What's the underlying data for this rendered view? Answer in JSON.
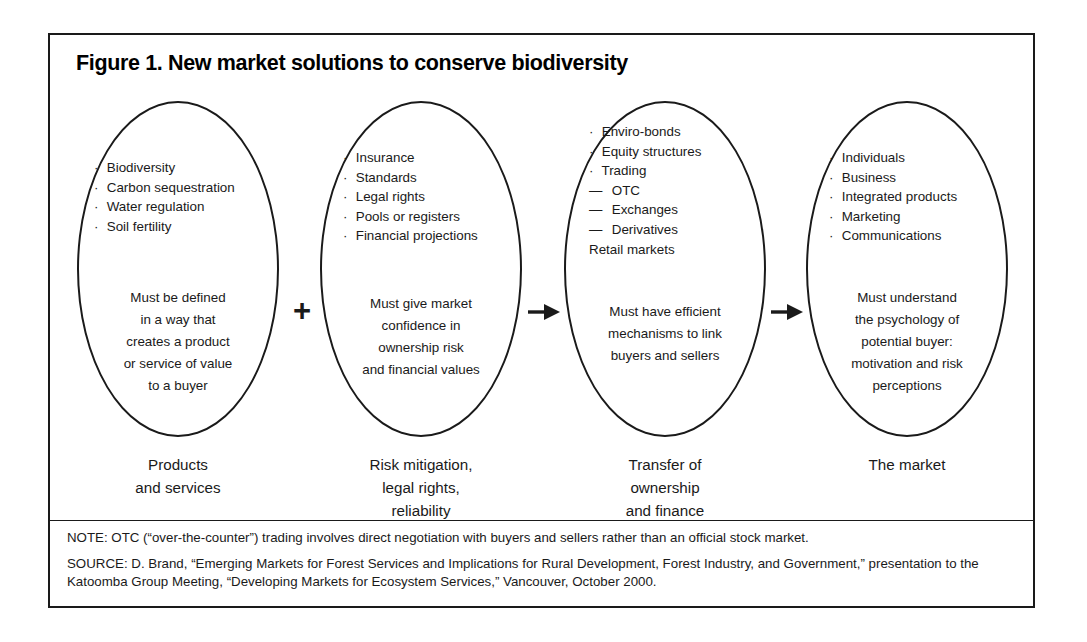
{
  "figure": {
    "title": "Figure 1. New market solutions to conserve biodiversity"
  },
  "stages": [
    {
      "caption": "Products\nand services",
      "bullets": [
        {
          "mark": "·",
          "text": "Biodiversity"
        },
        {
          "mark": "·",
          "text": "Carbon sequestration"
        },
        {
          "mark": "·",
          "text": "Water regulation"
        },
        {
          "mark": "·",
          "text": "Soil fertility"
        }
      ],
      "description": "Must be defined\nin a way that\ncreates a product\nor service of value\nto a buyer"
    },
    {
      "caption": "Risk mitigation,\nlegal rights,\nreliability",
      "bullets": [
        {
          "mark": "·",
          "text": "Insurance"
        },
        {
          "mark": "·",
          "text": "Standards"
        },
        {
          "mark": "·",
          "text": "Legal rights"
        },
        {
          "mark": "·",
          "text": "Pools or registers"
        },
        {
          "mark": "·",
          "text": "Financial projections"
        }
      ],
      "description": "Must give market\nconfidence in\nownership risk\nand financial values"
    },
    {
      "caption": "Transfer of\nownership\nand finance",
      "bullets": [
        {
          "mark": "·",
          "text": "Enviro-bonds"
        },
        {
          "mark": "·",
          "text": "Equity structures"
        },
        {
          "mark": "·",
          "text": "Trading"
        },
        {
          "mark": "—",
          "text": "OTC"
        },
        {
          "mark": "—",
          "text": "Exchanges"
        },
        {
          "mark": "—",
          "text": "Derivatives"
        },
        {
          "mark": "",
          "text": "Retail markets"
        }
      ],
      "description": "Must have efficient\nmechanisms to link\nbuyers and sellers"
    },
    {
      "caption": "The market",
      "bullets": [
        {
          "mark": "·",
          "text": "Individuals"
        },
        {
          "mark": "·",
          "text": "Business"
        },
        {
          "mark": "·",
          "text": "Integrated products"
        },
        {
          "mark": "·",
          "text": "Marketing"
        },
        {
          "mark": "·",
          "text": "Communications"
        }
      ],
      "description": "Must understand\nthe psychology of\npotential buyer:\nmotivation and risk\nperceptions"
    }
  ],
  "connectors": [
    {
      "kind": "plus",
      "glyph": "+"
    },
    {
      "kind": "arrow",
      "glyph": "➜"
    },
    {
      "kind": "arrow",
      "glyph": "➜"
    }
  ],
  "footnotes": [
    {
      "label": "NOTE:",
      "text": " OTC (“over-the-counter”) trading involves direct negotiation with buyers and sellers rather than an official stock market."
    },
    {
      "label": "SOURCE:",
      "text": " D. Brand, “Emerging Markets for Forest Services and Implications for Rural Development, Forest Industry, and Government,” presentation to the Katoomba Group Meeting, “Developing Markets for Ecosystem Services,” Vancouver, October 2000."
    }
  ],
  "colors": {
    "ink": "#1a1a1a",
    "page": "#ffffff"
  }
}
